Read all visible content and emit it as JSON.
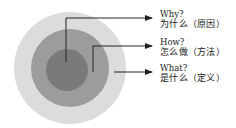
{
  "diagram": {
    "type": "golden-circle",
    "circles": [
      {
        "name": "outer",
        "color": "#dcdcdc"
      },
      {
        "name": "middle",
        "color": "#9c9c9c"
      },
      {
        "name": "inner",
        "color": "#7a7a7a"
      }
    ],
    "labels": [
      {
        "en": "Why?",
        "zh": "为什么（原因）"
      },
      {
        "en": "How?",
        "zh": "怎么做（方法）"
      },
      {
        "en": "What?",
        "zh": "是什么（定义）"
      }
    ],
    "arrow_color": "#222222"
  }
}
